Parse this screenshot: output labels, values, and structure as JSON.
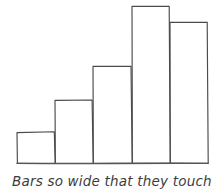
{
  "figure": {
    "caption": "Bars so wide that they touch",
    "description_name": "hand-drawn-histogram",
    "stroke_color": "#4a4a4a",
    "background_color": "#ffffff",
    "caption_color": "#3d3d3d"
  },
  "chart_data": {
    "type": "bar",
    "title": "",
    "subtitle": "",
    "xlabel": "",
    "ylabel": "",
    "categories": [
      "1",
      "2",
      "3",
      "4",
      "5"
    ],
    "values": [
      31,
      63,
      97,
      157,
      141
    ],
    "ylim": [
      0,
      163
    ],
    "grid": false,
    "legend": null,
    "annotations": [
      "Bars so wide that they touch"
    ],
    "bars": [
      {
        "label": "1",
        "x_left": 17,
        "x_right": 55,
        "top": 132,
        "bottom": 163,
        "height": 31
      },
      {
        "label": "2",
        "x_left": 55,
        "x_right": 93,
        "top": 100,
        "bottom": 163,
        "height": 63
      },
      {
        "label": "3",
        "x_left": 93,
        "x_right": 132,
        "top": 66,
        "bottom": 163,
        "height": 97
      },
      {
        "label": "4",
        "x_left": 132,
        "x_right": 170,
        "top": 6,
        "bottom": 163,
        "height": 157
      },
      {
        "label": "5",
        "x_left": 170,
        "x_right": 208,
        "top": 22,
        "bottom": 163,
        "height": 141
      }
    ],
    "baseline": {
      "y": 163,
      "x_start": 17,
      "x_end": 208
    }
  }
}
